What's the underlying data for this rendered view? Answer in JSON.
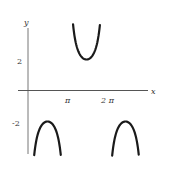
{
  "chart_data": {
    "type": "line",
    "title": "",
    "function": "y = -2 csc(x)",
    "xlabel": "x",
    "ylabel": "y",
    "x_ticks": [
      {
        "value": 3.14159,
        "label": "π"
      },
      {
        "value": 6.28319,
        "label": "2 π"
      }
    ],
    "y_ticks": [
      {
        "value": 2,
        "label": "2"
      },
      {
        "value": -2,
        "label": "-2"
      }
    ],
    "xlim": [
      -0.6,
      10.2
    ],
    "ylim": [
      -3.9,
      4.0
    ],
    "grid": false,
    "legend": null,
    "series": [
      {
        "name": "branch-1",
        "x_range": [
          0.5,
          2.64
        ],
        "extremum": {
          "x": 1.5708,
          "y": -2
        },
        "shape": "arch-down"
      },
      {
        "name": "branch-2",
        "x_range": [
          3.63,
          5.79
        ],
        "extremum": {
          "x": 4.7124,
          "y": 2
        },
        "shape": "cup-up"
      },
      {
        "name": "branch-3",
        "x_range": [
          6.78,
          8.92
        ],
        "extremum": {
          "x": 7.854,
          "y": -2
        },
        "shape": "arch-down"
      }
    ],
    "color": "#1a1a1a"
  }
}
